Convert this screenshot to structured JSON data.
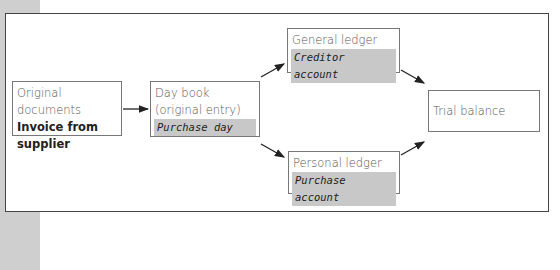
{
  "diagram": {
    "nodes": {
      "original": {
        "title": "Original documents",
        "detail_line1": "Invoice from",
        "detail_line2": "supplier"
      },
      "daybook": {
        "title_line1": "Day book",
        "title_line2": "(original entry)",
        "highlight": "Purchase day"
      },
      "general": {
        "title": "General ledger",
        "highlight": "Creditor account"
      },
      "personal": {
        "title": "Personal ledger",
        "highlight": "Purchase account"
      },
      "trial": {
        "title": "Trial balance"
      }
    },
    "edges": [
      {
        "from": "original",
        "to": "daybook"
      },
      {
        "from": "daybook",
        "to": "general"
      },
      {
        "from": "daybook",
        "to": "personal"
      },
      {
        "from": "general",
        "to": "trial"
      },
      {
        "from": "personal",
        "to": "trial"
      }
    ],
    "colors": {
      "highlight": "#c8c8c8",
      "frame": "#444444",
      "side_strip": "#cfcfcf"
    }
  }
}
